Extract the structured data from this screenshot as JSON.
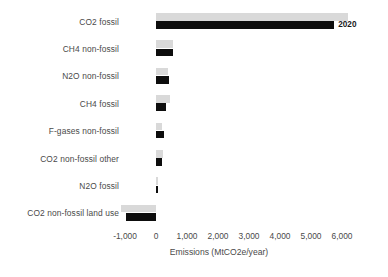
{
  "chart_data": {
    "type": "bar",
    "orientation": "horizontal",
    "title": "",
    "subtitle": "",
    "xlabel": "Emissions (MtCO2e/year)",
    "ylabel": "",
    "xlim": [
      -1000,
      6000
    ],
    "xticks": [
      "-1,000",
      "0",
      "1,000",
      "2,000",
      "3,000",
      "4,000",
      "5,000",
      "6,000"
    ],
    "xtick_values": [
      -1000,
      0,
      1000,
      2000,
      3000,
      4000,
      5000,
      6000
    ],
    "grid": false,
    "legend": "none",
    "categories": [
      "CO2 fossil",
      "CH4 non-fossil",
      "N2O non-fossil",
      "CH4 fossil",
      "F-gases non-fossil",
      "CO2 non-fossil other",
      "N2O fossil",
      "CO2 non-fossil land use"
    ],
    "series": [
      {
        "name": "upper-light-series",
        "color": "#d9d9d9",
        "values": [
          6200,
          560,
          400,
          450,
          200,
          230,
          60,
          -1130
        ]
      },
      {
        "name": "lower-dark-series",
        "color": "#0d0d0d",
        "values": [
          5750,
          560,
          430,
          330,
          250,
          180,
          60,
          -970
        ]
      }
    ],
    "annotations": [
      {
        "text": "2020",
        "category": "CO2 fossil",
        "series": "lower-dark-series"
      }
    ]
  }
}
